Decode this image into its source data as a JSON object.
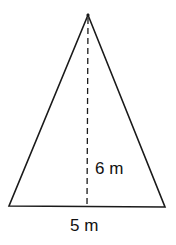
{
  "diagram": {
    "shape": "isosceles-triangle",
    "height_label": "6 m",
    "base_label": "5 m",
    "colors": {
      "stroke": "#1a1a1a",
      "background": "#ffffff"
    }
  }
}
